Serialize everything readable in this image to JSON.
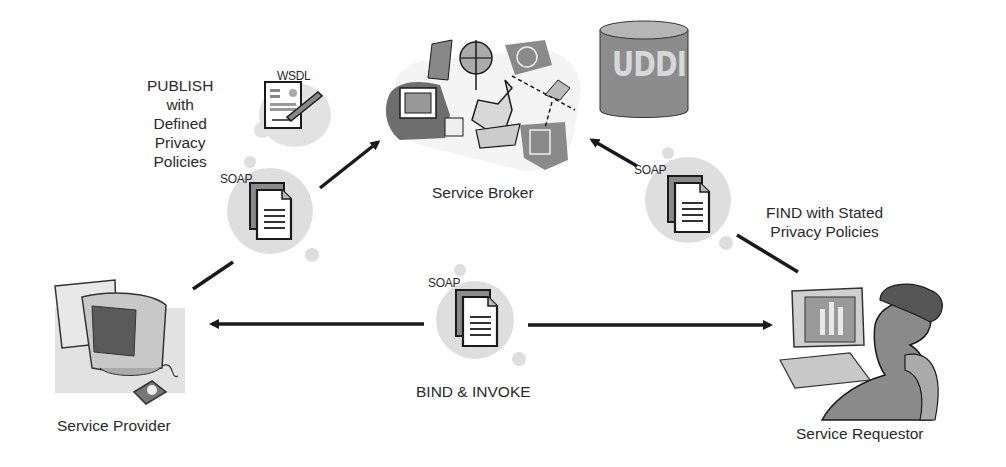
{
  "diagram": {
    "nodes": {
      "broker": {
        "label": "Service Broker",
        "icon": "service-broker-clipart"
      },
      "registry": {
        "label": "UDDI",
        "icon": "database-cylinder"
      },
      "provider": {
        "label": "Service Provider",
        "icon": "desktop-computer-clipart"
      },
      "requestor": {
        "label": "Service Requestor",
        "icon": "woman-at-computer-clipart"
      }
    },
    "edges": {
      "publish": {
        "label_lines": [
          "PUBLISH",
          "with",
          "Defined",
          "Privacy",
          "Policies"
        ],
        "message": "SOAP",
        "artifact": "WSDL",
        "from": "Service Provider",
        "to": "Service Broker"
      },
      "find": {
        "label_lines": [
          "FIND with Stated",
          "Privacy Policies"
        ],
        "message": "SOAP",
        "from": "Service Requestor",
        "to": "Service Broker"
      },
      "bind": {
        "label": "BIND & INVOKE",
        "message": "SOAP",
        "between": [
          "Service Provider",
          "Service Requestor"
        ]
      }
    },
    "colors": {
      "ink": "#1a1a1a",
      "blob": "#dedede",
      "clipart_dark": "#6e6e6e",
      "clipart_mid": "#a8a8a8",
      "clipart_light": "#d4d4d4"
    }
  }
}
